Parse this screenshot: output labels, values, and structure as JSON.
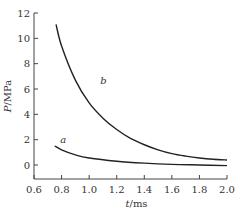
{
  "chart_data": {
    "type": "line",
    "title": "",
    "xlabel": "t/ms",
    "ylabel": "P/MPa",
    "xlim": [
      0.6,
      2.0
    ],
    "ylim": [
      -1,
      12
    ],
    "xticks": [
      0.6,
      0.8,
      1.0,
      1.2,
      1.4,
      1.6,
      1.8,
      2.0
    ],
    "yticks": [
      0,
      2,
      4,
      6,
      8,
      10,
      12
    ],
    "grid": false,
    "legend": "none (inline curve labels)",
    "series": [
      {
        "name": "a",
        "x": [
          0.75,
          0.8,
          0.9,
          1.0,
          1.2,
          1.4,
          1.6,
          1.8,
          2.0
        ],
        "values": [
          1.5,
          1.2,
          0.8,
          0.55,
          0.3,
          0.15,
          0.05,
          0.0,
          -0.05
        ],
        "label_pos": [
          0.79,
          1.7
        ]
      },
      {
        "name": "b",
        "x": [
          0.76,
          0.8,
          0.9,
          1.0,
          1.1,
          1.2,
          1.3,
          1.4,
          1.5,
          1.6,
          1.7,
          1.8,
          1.9,
          2.0
        ],
        "values": [
          11.1,
          9.4,
          6.7,
          4.9,
          3.7,
          2.8,
          2.1,
          1.6,
          1.2,
          0.9,
          0.7,
          0.55,
          0.45,
          0.4
        ],
        "label_pos": [
          1.08,
          6.4
        ]
      }
    ]
  },
  "axes": {
    "x_title_var": "t",
    "x_title_unit": "/ms",
    "y_title_var": "P",
    "y_title_unit": "/MPa"
  }
}
